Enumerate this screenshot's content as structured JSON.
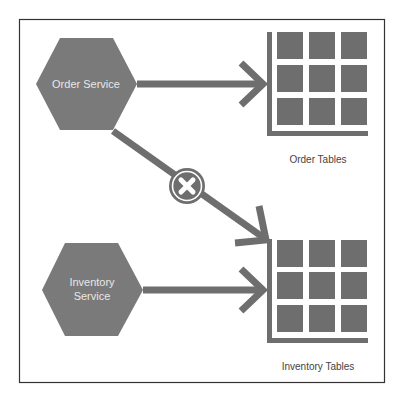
{
  "diagram": {
    "colors": {
      "shape_fill": "#7a7a7a",
      "line": "#6e6e6e",
      "frame": "#333333",
      "node_text": "#e8e8e8",
      "label_text": "#444444",
      "background": "#ffffff"
    },
    "nodes": {
      "order_service": {
        "label": "Order Service"
      },
      "inventory_service": {
        "line1": "Inventory",
        "line2": "Service"
      }
    },
    "tables": {
      "order_tables": {
        "label": "Order Tables"
      },
      "inventory_tables": {
        "label": "Inventory Tables"
      }
    },
    "edges": [
      {
        "from": "Order Service",
        "to": "Order Tables",
        "allowed": true
      },
      {
        "from": "Order Service",
        "to": "Inventory Tables",
        "allowed": false,
        "marker": "x-circle-icon"
      },
      {
        "from": "Inventory Service",
        "to": "Inventory Tables",
        "allowed": true
      }
    ]
  }
}
